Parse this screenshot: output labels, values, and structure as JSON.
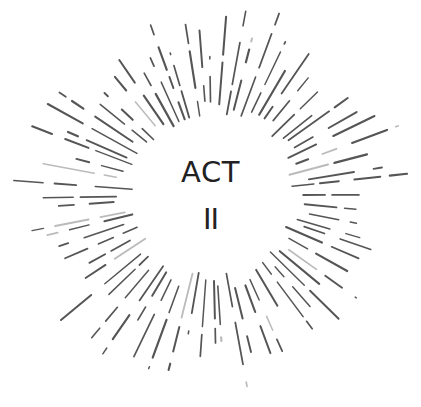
{
  "title": {
    "line1": "ACT",
    "line2": "II"
  },
  "colors": {
    "background": "#ffffff",
    "text": "#222222",
    "rays": "#555555",
    "rays_light": "#bbbbbb"
  },
  "burst": {
    "center": [
      212,
      195
    ],
    "inner_radius": 80,
    "outer_radius": 200,
    "ray_count": 72,
    "seed": 7
  }
}
